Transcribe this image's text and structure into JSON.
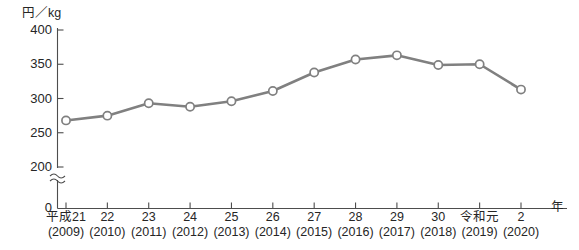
{
  "chart_data": {
    "type": "line",
    "title": "",
    "subtitle": "",
    "ylabel": "円／kg",
    "xlabel": "年",
    "ylim": [
      200,
      400
    ],
    "yticks": [
      200,
      250,
      300,
      350,
      400
    ],
    "ytick_labels": [
      "200",
      "250",
      "300",
      "350",
      "400"
    ],
    "y_axis_origin_label": "0",
    "y_axis_break": true,
    "y_axis_break_symbol": "≈",
    "grid": false,
    "legend": "none",
    "marker": "open-circle",
    "line_color": "#808080",
    "marker_fill": "#ffffff",
    "marker_edge": "#808080",
    "axis_color": "#4d4d4d",
    "categories": [
      "平成21",
      "22",
      "23",
      "24",
      "25",
      "26",
      "27",
      "28",
      "29",
      "30",
      "令和元",
      "2"
    ],
    "category_years": [
      "(2009)",
      "(2010)",
      "(2011)",
      "(2012)",
      "(2013)",
      "(2014)",
      "(2015)",
      "(2016)",
      "(2017)",
      "(2018)",
      "(2019)",
      "(2020)"
    ],
    "values": [
      268,
      275,
      293,
      288,
      296,
      311,
      338,
      357,
      363,
      349,
      350,
      313
    ],
    "series": [
      {
        "name": "価格",
        "values": [
          268,
          275,
          293,
          288,
          296,
          311,
          338,
          357,
          363,
          349,
          350,
          313
        ]
      }
    ],
    "annotations": []
  }
}
